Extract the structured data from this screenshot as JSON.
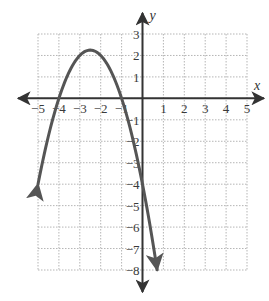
{
  "chart_data": {
    "type": "line",
    "title": "",
    "xlabel": "x",
    "ylabel": "y",
    "xlim": [
      -5,
      5
    ],
    "ylim": [
      -8,
      3
    ],
    "grid": true,
    "grid_style": "dotted",
    "x_ticks": [
      -5,
      -4,
      -3,
      -2,
      -1,
      1,
      2,
      3,
      4,
      5
    ],
    "x_tick_labels": [
      "−5",
      "−4",
      "−3",
      "−2",
      "−1",
      "1",
      "2",
      "3",
      "4",
      "5"
    ],
    "y_ticks": [
      3,
      2,
      1,
      -1,
      -2,
      -3,
      -4,
      -5,
      -6,
      -7,
      -8
    ],
    "y_tick_labels": [
      "3",
      "2",
      "1",
      "−1",
      "−2",
      "−3",
      "−4",
      "−5",
      "−6",
      "−7",
      "−8"
    ],
    "series": [
      {
        "name": "parabola",
        "equation": "y = -x^2 - 5x - 4",
        "x_range": [
          -5,
          0.7
        ],
        "vertex": [
          -2.5,
          2.25
        ],
        "x_intercepts": [
          -4,
          -1
        ],
        "y_intercept": -4,
        "arrows_at_ends": true,
        "x": [
          -5,
          -4.5,
          -4,
          -3.5,
          -3,
          -2.5,
          -2,
          -1.5,
          -1,
          -0.5,
          0,
          0.5,
          0.7
        ],
        "y": [
          -4,
          -1.75,
          0,
          1.25,
          2,
          2.25,
          2,
          1.25,
          0,
          -1.75,
          -4,
          -6.75,
          -7.99
        ]
      }
    ],
    "colors": {
      "curve": "#555555",
      "axes": "#333333",
      "grid": "#b5b5b5"
    }
  },
  "labels": {
    "x_axis": "x",
    "y_axis": "y"
  }
}
